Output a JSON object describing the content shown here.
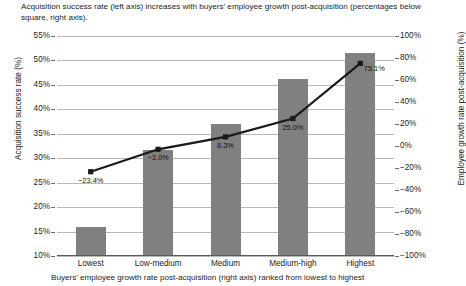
{
  "chart_data": {
    "type": "bar",
    "title": "Acquisition success rate (left axis) increases with buyers' employee growth post-acquisition (percentages below square, right axis).",
    "categories": [
      "Lowest",
      "Low-medium",
      "Medium",
      "Medium-high",
      "Highest"
    ],
    "xlabel": "Buyers' employee growth rate post-acquisition (right axis) ranked from lowest to highest",
    "series": [
      {
        "name": "Acquisition success rate (%)",
        "type": "bar",
        "axis": "left",
        "values": [
          16.0,
          31.6,
          37.0,
          46.2,
          51.5
        ],
        "color": "#808080"
      },
      {
        "name": "Employee growth rate post-acquisition (%)",
        "type": "line",
        "axis": "right",
        "values": [
          -23.4,
          -3.0,
          8.3,
          25.0,
          75.1
        ],
        "labels": [
          "−23.4%",
          "−3.0%",
          "8.3%",
          "25.0%",
          "75.1%"
        ],
        "color": "#1a1a1a"
      }
    ],
    "left_axis": {
      "label": "Acquisition success rate (%)",
      "ylim": [
        10,
        55
      ],
      "ticks": [
        "10%",
        "15%",
        "20%",
        "25%",
        "30%",
        "35%",
        "40%",
        "45%",
        "50%",
        "55%"
      ],
      "tick_values": [
        10,
        15,
        20,
        25,
        30,
        35,
        40,
        45,
        50,
        55
      ]
    },
    "right_axis": {
      "label": "Employee growth rate post-acquisition (%)",
      "ylim": [
        -100,
        100
      ],
      "ticks": [
        "−100%",
        "−80%",
        "−60%",
        "−40%",
        "−20%",
        "0%",
        "20%",
        "40%",
        "60%",
        "80%",
        "100%"
      ],
      "tick_values": [
        -100,
        -80,
        -60,
        -40,
        -20,
        0,
        20,
        40,
        60,
        80,
        100
      ]
    },
    "grid": true,
    "legend": "none"
  }
}
